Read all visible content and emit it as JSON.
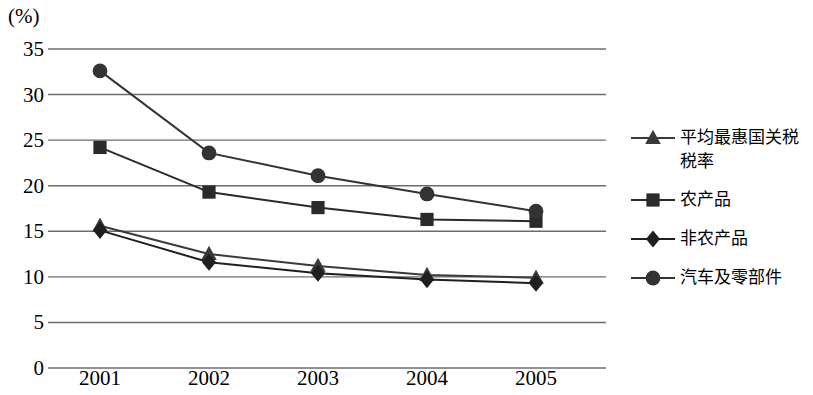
{
  "axis": {
    "unit_label": "(%)",
    "y_ticks": [
      "0",
      "5",
      "10",
      "15",
      "20",
      "25",
      "30",
      "35"
    ],
    "x_ticks": [
      "2001",
      "2002",
      "2003",
      "2004",
      "2005"
    ]
  },
  "legend": {
    "items": [
      {
        "label": "平均最惠国关税税率",
        "marker": "triangle-marker",
        "color": "#3a3a3a"
      },
      {
        "label": "农产品",
        "marker": "square-marker",
        "color": "#2a2a2a"
      },
      {
        "label": "非农产品",
        "marker": "diamond-marker",
        "color": "#1f1f1f"
      },
      {
        "label": "汽车及零部件",
        "marker": "circle-marker",
        "color": "#333333"
      }
    ]
  },
  "chart_data": {
    "type": "line",
    "title": "",
    "subtitle": "",
    "xlabel": "",
    "ylabel": "(%)",
    "categories": [
      "2001",
      "2002",
      "2003",
      "2004",
      "2005"
    ],
    "ylim": [
      0,
      35
    ],
    "ytick_step": 5,
    "grid": "horizontal",
    "legend_position": "right",
    "series": [
      {
        "name": "平均最惠国关税税率",
        "marker": "triangle",
        "color": "#3a3a3a",
        "values": [
          15.6,
          12.5,
          11.2,
          10.2,
          9.9
        ]
      },
      {
        "name": "农产品",
        "marker": "square",
        "color": "#2a2a2a",
        "values": [
          24.2,
          19.3,
          17.6,
          16.3,
          16.1
        ]
      },
      {
        "name": "非农产品",
        "marker": "diamond",
        "color": "#1f1f1f",
        "values": [
          15.1,
          11.6,
          10.4,
          9.7,
          9.3
        ]
      },
      {
        "name": "汽车及零部件",
        "marker": "circle",
        "color": "#333333",
        "values": [
          32.6,
          23.6,
          21.1,
          19.1,
          17.2
        ]
      }
    ]
  }
}
